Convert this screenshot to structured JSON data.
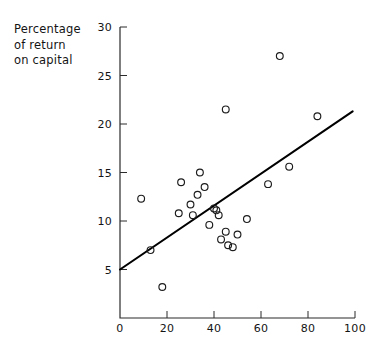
{
  "chart_data": {
    "type": "scatter",
    "title": "",
    "subtitle": "",
    "ylabel_lines": [
      "Percentage",
      "of return",
      "on capital"
    ],
    "ylabel": "Percentage of return on capital",
    "xlabel": "",
    "xlim": [
      0,
      100
    ],
    "ylim": [
      0,
      30
    ],
    "xticks": [
      0,
      20,
      40,
      60,
      80,
      100
    ],
    "yticks": [
      5,
      10,
      15,
      20,
      25,
      30
    ],
    "xtick_labels": [
      "0",
      "20",
      "40",
      "60",
      "80",
      "100"
    ],
    "ytick_labels": [
      "5",
      "10",
      "15",
      "20",
      "25",
      "30"
    ],
    "grid": false,
    "legend": "none",
    "marker": "open-circle",
    "points": [
      {
        "x": 9,
        "y": 12.3
      },
      {
        "x": 13,
        "y": 7.0
      },
      {
        "x": 18,
        "y": 3.2
      },
      {
        "x": 25,
        "y": 10.8
      },
      {
        "x": 26,
        "y": 14.0
      },
      {
        "x": 30,
        "y": 11.7
      },
      {
        "x": 31,
        "y": 10.6
      },
      {
        "x": 33,
        "y": 12.7
      },
      {
        "x": 34,
        "y": 15.0
      },
      {
        "x": 36,
        "y": 13.5
      },
      {
        "x": 38,
        "y": 9.6
      },
      {
        "x": 40,
        "y": 11.3
      },
      {
        "x": 41,
        "y": 11.1
      },
      {
        "x": 42,
        "y": 10.6
      },
      {
        "x": 43,
        "y": 8.1
      },
      {
        "x": 45,
        "y": 21.5
      },
      {
        "x": 45,
        "y": 8.9
      },
      {
        "x": 46,
        "y": 7.5
      },
      {
        "x": 48,
        "y": 7.3
      },
      {
        "x": 50,
        "y": 8.6
      },
      {
        "x": 54,
        "y": 10.2
      },
      {
        "x": 63,
        "y": 13.8
      },
      {
        "x": 68,
        "y": 27.0
      },
      {
        "x": 72,
        "y": 15.6
      },
      {
        "x": 84,
        "y": 20.8
      }
    ],
    "trend_line": {
      "type": "line",
      "x_start": 0,
      "y_start": 5.0,
      "x_end": 99,
      "y_end": 21.3
    }
  },
  "axis_label": {
    "line1": "Percentage",
    "line2": "of return",
    "line3": "on capital"
  }
}
